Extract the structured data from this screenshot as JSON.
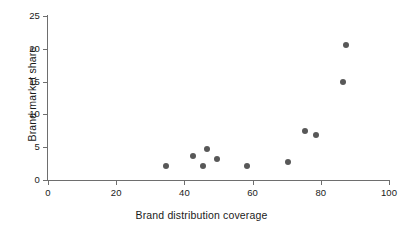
{
  "chart_data": {
    "type": "scatter",
    "title": "",
    "xlabel": "Brand distribution coverage",
    "ylabel": "Brand market share",
    "xlim": [
      0,
      100
    ],
    "ylim": [
      0,
      25
    ],
    "xticks": [
      0,
      20,
      40,
      60,
      80,
      100
    ],
    "yticks": [
      0,
      5,
      10,
      15,
      20,
      25
    ],
    "xtick_labels": [
      "0",
      "20",
      "40",
      "60",
      "80",
      "100"
    ],
    "ytick_labels": [
      "0",
      "5",
      "10",
      "15",
      "20",
      "25"
    ],
    "grid": false,
    "legend": false,
    "marker_color": "#585858",
    "axis_color": "#6e6e6e",
    "series": [
      {
        "name": "brands",
        "points": [
          {
            "x": 34.5,
            "y": 2.2
          },
          {
            "x": 42.5,
            "y": 3.6
          },
          {
            "x": 45.5,
            "y": 2.2
          },
          {
            "x": 46.5,
            "y": 4.8
          },
          {
            "x": 49.5,
            "y": 3.2
          },
          {
            "x": 58.5,
            "y": 2.1
          },
          {
            "x": 70.5,
            "y": 2.8
          },
          {
            "x": 75.5,
            "y": 7.4
          },
          {
            "x": 78.5,
            "y": 6.9
          },
          {
            "x": 86.5,
            "y": 15.0
          },
          {
            "x": 87.5,
            "y": 20.6
          }
        ]
      }
    ]
  }
}
